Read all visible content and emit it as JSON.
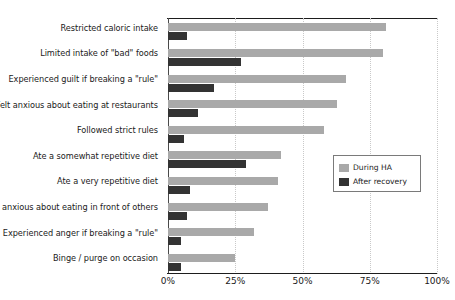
{
  "chart_data": {
    "type": "bar",
    "orientation": "horizontal",
    "title": "",
    "subtitle": "",
    "xlabel": "",
    "ylabel": "",
    "xlim": [
      0,
      100
    ],
    "xticks": [
      0,
      25,
      50,
      75,
      100
    ],
    "xtick_labels": [
      "0%",
      "25%",
      "50%",
      "75%",
      "100%"
    ],
    "grid": true,
    "grid_axis": "x",
    "legend_position": "center-right",
    "categories": [
      "Restricted caloric intake",
      "Limited intake of \"bad\" foods",
      "Experienced guilt if breaking a \"rule\"",
      "Felt anxious about eating at restaurants",
      "Followed strict rules",
      "Ate a somewhat repetitive diet",
      "Ate a very repetitive diet",
      "Felt anxious about eating in front of others",
      "Experienced anger if breaking a \"rule\"",
      "Binge / purge on occasion"
    ],
    "series": [
      {
        "name": "During HA",
        "color": "#a9a9a9",
        "values": [
          81,
          80,
          66,
          63,
          58,
          42,
          41,
          37,
          32,
          25
        ]
      },
      {
        "name": "After recovery",
        "color": "#333333",
        "values": [
          7,
          27,
          17,
          11,
          6,
          29,
          8,
          7,
          5,
          5
        ]
      }
    ]
  },
  "legend": {
    "items": [
      {
        "label": "During HA",
        "color": "#a9a9a9"
      },
      {
        "label": "After recovery",
        "color": "#333333"
      }
    ]
  },
  "colors": {
    "during_ha": "#a9a9a9",
    "after_recovery": "#333333",
    "axis": "#1d1d1d",
    "gridline": "#c9c9c9",
    "text": "#1a1a1a",
    "background": "#ffffff"
  }
}
